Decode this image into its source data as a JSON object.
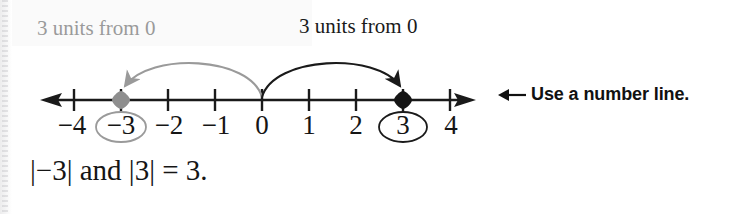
{
  "figure": {
    "background_color": "#ffffff"
  },
  "callouts": {
    "left": {
      "text": "3 units from 0",
      "color": "#9a9a9a"
    },
    "right": {
      "text": "3 units from 0",
      "color": "#1a1a1a"
    }
  },
  "number_line": {
    "min": -4,
    "max": 4,
    "origin_value": 0,
    "arrow_both_ends": true,
    "line_color": "#1a1a1a",
    "tick_labels": [
      {
        "value": -4,
        "text": "−4",
        "circled": false,
        "circle_color": ""
      },
      {
        "value": -3,
        "text": "−3",
        "circled": true,
        "circle_color": "#9a9a9a"
      },
      {
        "value": -2,
        "text": "−2",
        "circled": false,
        "circle_color": ""
      },
      {
        "value": -1,
        "text": "−1",
        "circled": false,
        "circle_color": ""
      },
      {
        "value": 0,
        "text": "0",
        "circled": false,
        "circle_color": ""
      },
      {
        "value": 1,
        "text": "1",
        "circled": false,
        "circle_color": ""
      },
      {
        "value": 2,
        "text": "2",
        "circled": false,
        "circle_color": ""
      },
      {
        "value": 3,
        "text": "3",
        "circled": true,
        "circle_color": "#1a1a1a"
      },
      {
        "value": 4,
        "text": "4",
        "circled": false,
        "circle_color": ""
      }
    ],
    "markers": [
      {
        "value": -3,
        "shape": "diamond",
        "color": "#8e8e8e",
        "label": "negative-three-point"
      },
      {
        "value": 3,
        "shape": "diamond",
        "color": "#151515",
        "label": "positive-three-point"
      }
    ],
    "arcs": [
      {
        "from": 0,
        "to": -3,
        "color": "#9a9a9a",
        "direction": "left",
        "label": "3 units from 0"
      },
      {
        "from": 0,
        "to": 3,
        "color": "#1a1a1a",
        "direction": "right",
        "label": "3 units from 0"
      }
    ]
  },
  "annotation": {
    "arrow_icon": "left-arrow-icon",
    "text": "Use a number line."
  },
  "equation": {
    "text": "|−3| and |3| = 3."
  }
}
